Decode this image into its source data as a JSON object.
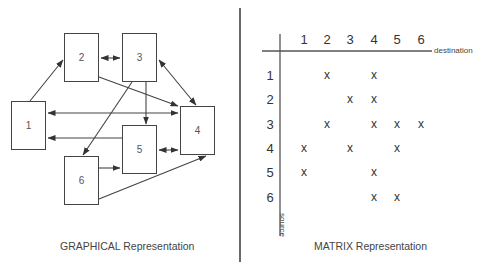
{
  "graphical": {
    "caption": "GRAPHICAL Representation",
    "nodes": [
      {
        "id": "1",
        "label": "1",
        "x": 11,
        "y": 101,
        "w": 35,
        "h": 49
      },
      {
        "id": "2",
        "label": "2",
        "x": 64,
        "y": 33,
        "w": 35,
        "h": 49
      },
      {
        "id": "3",
        "label": "3",
        "x": 122,
        "y": 33,
        "w": 35,
        "h": 49
      },
      {
        "id": "4",
        "label": "4",
        "x": 180,
        "y": 106,
        "w": 35,
        "h": 49
      },
      {
        "id": "5",
        "label": "5",
        "x": 122,
        "y": 125,
        "w": 35,
        "h": 49
      },
      {
        "id": "6",
        "label": "6",
        "x": 64,
        "y": 156,
        "w": 35,
        "h": 49
      }
    ],
    "edges": [
      {
        "from": "1",
        "to": "2",
        "bidirectional": false
      },
      {
        "from": "1",
        "to": "4",
        "bidirectional": true
      },
      {
        "from": "2",
        "to": "3",
        "bidirectional": true
      },
      {
        "from": "2",
        "to": "4",
        "bidirectional": false
      },
      {
        "from": "3",
        "to": "4",
        "bidirectional": true
      },
      {
        "from": "3",
        "to": "5",
        "bidirectional": false
      },
      {
        "from": "3",
        "to": "6",
        "bidirectional": false
      },
      {
        "from": "4",
        "to": "5",
        "bidirectional": true
      },
      {
        "from": "5",
        "to": "1",
        "bidirectional": false
      },
      {
        "from": "6",
        "to": "4",
        "bidirectional": false
      },
      {
        "from": "6",
        "to": "5",
        "bidirectional": false
      }
    ]
  },
  "matrix": {
    "caption": "MATRIX Representation",
    "column_axis_label": "destination",
    "row_axis_label": "source",
    "columns": [
      "1",
      "2",
      "3",
      "4",
      "5",
      "6"
    ],
    "rows": [
      "1",
      "2",
      "3",
      "4",
      "5",
      "6"
    ],
    "mark_symbol": "x",
    "cells": [
      [
        "",
        "x",
        "",
        "x",
        "",
        ""
      ],
      [
        "",
        "",
        "x",
        "x",
        "",
        ""
      ],
      [
        "",
        "x",
        "",
        "x",
        "x",
        "x"
      ],
      [
        "x",
        "",
        "x",
        "",
        "x",
        ""
      ],
      [
        "x",
        "",
        "",
        "x",
        "",
        ""
      ],
      [
        "",
        "",
        "",
        "x",
        "x",
        ""
      ]
    ]
  },
  "colors": {
    "line": "#444444",
    "divider": "#6a6a6a",
    "text": "#333333",
    "background": "#ffffff"
  }
}
